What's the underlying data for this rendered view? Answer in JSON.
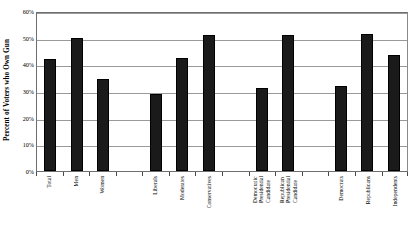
{
  "chart_data": {
    "type": "bar",
    "title": "",
    "xlabel": "",
    "ylabel": "Percent of Voters who Own Gun",
    "ylim": [
      0,
      60
    ],
    "ytick_labels": [
      "0%",
      "10%",
      "20%",
      "30%",
      "40%",
      "50%",
      "60%"
    ],
    "ytick_values": [
      0,
      10,
      20,
      30,
      40,
      50,
      60
    ],
    "grid": true,
    "legend": "none",
    "bar_color": "#1a1a1a",
    "categories": [
      "Total",
      "Men",
      "Women",
      "",
      "Liberals",
      "Moderates",
      "Conservatives",
      "",
      "Democratic Presidential Candidate",
      "Republican Presidential Candidate",
      "",
      "Democrats",
      "Republicans",
      "Independents"
    ],
    "category_lines": [
      [
        "Total"
      ],
      [
        "Men"
      ],
      [
        "Women"
      ],
      [
        ""
      ],
      [
        "Liberals"
      ],
      [
        "Moderates"
      ],
      [
        "Conservatives"
      ],
      [
        ""
      ],
      [
        "Democratic",
        "Presidential",
        "Candidate"
      ],
      [
        "Republican",
        "Presidential",
        "Candidate"
      ],
      [
        ""
      ],
      [
        "Democrats"
      ],
      [
        "Republicans"
      ],
      [
        "Independents"
      ]
    ],
    "values": [
      42,
      50,
      34.5,
      null,
      29,
      42.5,
      51,
      null,
      31,
      51,
      null,
      32,
      51.5,
      43.5
    ]
  }
}
